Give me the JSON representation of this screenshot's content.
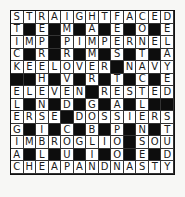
{
  "puzzle": {
    "type": "crossword",
    "size": {
      "rows": 13,
      "cols": 13
    },
    "block_symbol": "#",
    "rows": [
      "STRAIGHTFACED",
      "T#E#M#A#E#O#E",
      "IMP#PIMPERNEL",
      "C#R#R#M#S#T#A",
      "KEELOVER#NAVY",
      "##H#V#R#T#C#E",
      "ELEVEN#RESTED",
      "L#N#D#G#A#L##",
      "ERSE#DOSSIERS",
      "G#I#C#B#P#N#T",
      "IMBROGLIO#SOU",
      "A#L#U#I#O#E#D",
      "CHEAPANDNASTY"
    ],
    "across_answers": [
      "STRAIGHTFACED",
      "IMP",
      "PIMPERNEL",
      "KEELOVER",
      "NAVY",
      "ELEVEN",
      "RESTED",
      "ERSE",
      "DOSSIERS",
      "IMBROGLIO",
      "SOU",
      "CHEAPANDNASTY"
    ],
    "colors": {
      "background": "#f7f7f5",
      "cell": "#ffffff",
      "block": "#0d0d0d",
      "letter": "#1a1a1a"
    }
  }
}
